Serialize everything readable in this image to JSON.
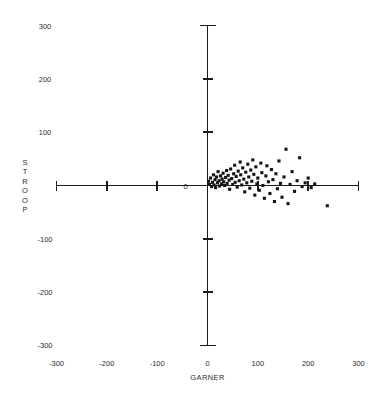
{
  "chart_data": {
    "type": "scatter",
    "title": "",
    "xlabel": "GARNER",
    "ylabel": "STROOP",
    "xlim": [
      -300,
      300
    ],
    "ylim": [
      -300,
      300
    ],
    "grid": false,
    "legend": null,
    "xticks": [
      -300,
      -200,
      -100,
      0,
      100,
      200,
      300
    ],
    "xtick_labels": [
      "-300",
      "-200",
      "-100",
      "0",
      "100",
      "200",
      "300"
    ],
    "yticks": [
      -300,
      -200,
      -100,
      0,
      100,
      200,
      300
    ],
    "ytick_labels": [
      "-300",
      "-200",
      "-100",
      "0",
      "100",
      "200",
      "300"
    ],
    "marker": "square",
    "marker_color": "#141414",
    "axis_color": "#1a1a1a",
    "points": [
      {
        "x": 2,
        "y": 8
      },
      {
        "x": 4,
        "y": 2
      },
      {
        "x": 6,
        "y": 14
      },
      {
        "x": 8,
        "y": -2
      },
      {
        "x": 10,
        "y": 6
      },
      {
        "x": 12,
        "y": 20
      },
      {
        "x": 13,
        "y": 1
      },
      {
        "x": 15,
        "y": 11
      },
      {
        "x": 16,
        "y": -4
      },
      {
        "x": 18,
        "y": 16
      },
      {
        "x": 20,
        "y": 5
      },
      {
        "x": 21,
        "y": 26
      },
      {
        "x": 23,
        "y": 9
      },
      {
        "x": 24,
        "y": -1
      },
      {
        "x": 26,
        "y": 18
      },
      {
        "x": 28,
        "y": 3
      },
      {
        "x": 29,
        "y": 12
      },
      {
        "x": 31,
        "y": 23
      },
      {
        "x": 32,
        "y": 7
      },
      {
        "x": 34,
        "y": 0
      },
      {
        "x": 36,
        "y": 15
      },
      {
        "x": 38,
        "y": 28
      },
      {
        "x": 39,
        "y": 4
      },
      {
        "x": 41,
        "y": 19
      },
      {
        "x": 43,
        "y": 10
      },
      {
        "x": 44,
        "y": -7
      },
      {
        "x": 46,
        "y": 31
      },
      {
        "x": 48,
        "y": 13
      },
      {
        "x": 50,
        "y": 2
      },
      {
        "x": 52,
        "y": 22
      },
      {
        "x": 54,
        "y": 38
      },
      {
        "x": 55,
        "y": 6
      },
      {
        "x": 57,
        "y": 17
      },
      {
        "x": 59,
        "y": -3
      },
      {
        "x": 61,
        "y": 27
      },
      {
        "x": 63,
        "y": 9
      },
      {
        "x": 65,
        "y": 44
      },
      {
        "x": 66,
        "y": 20
      },
      {
        "x": 68,
        "y": 1
      },
      {
        "x": 70,
        "y": 33
      },
      {
        "x": 72,
        "y": 12
      },
      {
        "x": 74,
        "y": -12
      },
      {
        "x": 76,
        "y": 25
      },
      {
        "x": 78,
        "y": 5
      },
      {
        "x": 80,
        "y": 40
      },
      {
        "x": 82,
        "y": 16
      },
      {
        "x": 84,
        "y": -5
      },
      {
        "x": 86,
        "y": 29
      },
      {
        "x": 88,
        "y": 8
      },
      {
        "x": 90,
        "y": 48
      },
      {
        "x": 92,
        "y": 21
      },
      {
        "x": 94,
        "y": -18
      },
      {
        "x": 96,
        "y": 35
      },
      {
        "x": 98,
        "y": 3
      },
      {
        "x": 100,
        "y": 14
      },
      {
        "x": 103,
        "y": -9
      },
      {
        "x": 106,
        "y": 42
      },
      {
        "x": 108,
        "y": 24
      },
      {
        "x": 110,
        "y": 0
      },
      {
        "x": 113,
        "y": -24
      },
      {
        "x": 116,
        "y": 18
      },
      {
        "x": 118,
        "y": 37
      },
      {
        "x": 121,
        "y": 7
      },
      {
        "x": 124,
        "y": -15
      },
      {
        "x": 127,
        "y": 30
      },
      {
        "x": 130,
        "y": 11
      },
      {
        "x": 133,
        "y": -30
      },
      {
        "x": 136,
        "y": 22
      },
      {
        "x": 139,
        "y": -6
      },
      {
        "x": 142,
        "y": 46
      },
      {
        "x": 145,
        "y": 4
      },
      {
        "x": 148,
        "y": -22
      },
      {
        "x": 152,
        "y": 16
      },
      {
        "x": 156,
        "y": 68
      },
      {
        "x": 160,
        "y": -34
      },
      {
        "x": 164,
        "y": 2
      },
      {
        "x": 168,
        "y": 26
      },
      {
        "x": 173,
        "y": -11
      },
      {
        "x": 178,
        "y": 9
      },
      {
        "x": 183,
        "y": 52
      },
      {
        "x": 188,
        "y": -2
      },
      {
        "x": 194,
        "y": 5
      },
      {
        "x": 200,
        "y": 14
      },
      {
        "x": 206,
        "y": -4
      },
      {
        "x": 213,
        "y": 3
      },
      {
        "x": 238,
        "y": -38
      }
    ]
  }
}
